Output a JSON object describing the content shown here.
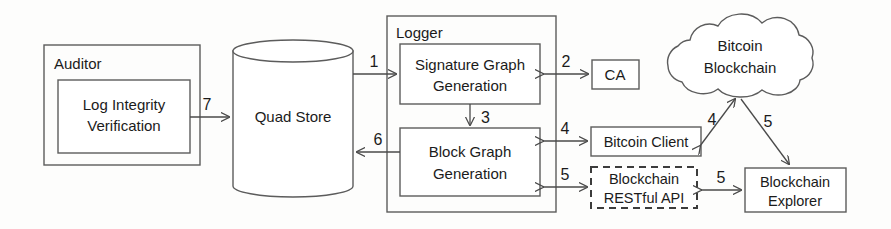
{
  "diagram": {
    "colors": {
      "stroke": "#5c5c5c",
      "text": "#1b1b1b",
      "background": "#fdfdfc",
      "edge": "#4a4a4a"
    },
    "groups": [
      {
        "id": "auditor",
        "label": "Auditor"
      },
      {
        "id": "logger",
        "label": "Logger"
      }
    ],
    "nodes": [
      {
        "id": "log-integrity-verification",
        "label_line1": "Log Integrity",
        "label_line2": "Verification",
        "shape": "rect",
        "parent": "auditor"
      },
      {
        "id": "quad-store",
        "label": "Quad Store",
        "shape": "cylinder",
        "parent": null
      },
      {
        "id": "signature-graph-generation",
        "label_line1": "Signature Graph",
        "label_line2": "Generation",
        "shape": "rect",
        "parent": "logger"
      },
      {
        "id": "block-graph-generation",
        "label_line1": "Block Graph",
        "label_line2": "Generation",
        "shape": "rect",
        "parent": "logger"
      },
      {
        "id": "ca",
        "label": "CA",
        "shape": "rect",
        "parent": null
      },
      {
        "id": "bitcoin-blockchain",
        "label_line1": "Bitcoin",
        "label_line2": "Blockchain",
        "shape": "cloud",
        "parent": null
      },
      {
        "id": "bitcoin-client",
        "label": "Bitcoin Client",
        "shape": "rect",
        "parent": null
      },
      {
        "id": "blockchain-restful-api",
        "label_line1": "Blockchain",
        "label_line2": "RESTful API",
        "shape": "rect-dashed",
        "parent": null
      },
      {
        "id": "blockchain-explorer",
        "label_line1": "Blockchain",
        "label_line2": "Explorer",
        "shape": "rect",
        "parent": null
      }
    ],
    "edges": [
      {
        "id": "edge-1",
        "label": "1",
        "from": "quad-store",
        "to": "signature-graph-generation",
        "direction": "one-way"
      },
      {
        "id": "edge-2",
        "label": "2",
        "from": "signature-graph-generation",
        "to": "ca",
        "direction": "two-way"
      },
      {
        "id": "edge-3",
        "label": "3",
        "from": "signature-graph-generation",
        "to": "block-graph-generation",
        "direction": "one-way"
      },
      {
        "id": "edge-4-logger",
        "label": "4",
        "from": "block-graph-generation",
        "to": "bitcoin-client",
        "direction": "two-way"
      },
      {
        "id": "edge-4-cloud",
        "label": "4",
        "from": "bitcoin-client",
        "to": "bitcoin-blockchain",
        "direction": "two-way"
      },
      {
        "id": "edge-5-logger",
        "label": "5",
        "from": "block-graph-generation",
        "to": "blockchain-restful-api",
        "direction": "two-way"
      },
      {
        "id": "edge-5-api",
        "label": "5",
        "from": "blockchain-restful-api",
        "to": "blockchain-explorer",
        "direction": "two-way"
      },
      {
        "id": "edge-5-cloud",
        "label": "5",
        "from": "bitcoin-blockchain",
        "to": "blockchain-explorer",
        "direction": "one-way"
      },
      {
        "id": "edge-6",
        "label": "6",
        "from": "block-graph-generation",
        "to": "quad-store",
        "direction": "one-way"
      },
      {
        "id": "edge-7",
        "label": "7",
        "from": "log-integrity-verification",
        "to": "quad-store",
        "direction": "one-way"
      }
    ]
  }
}
